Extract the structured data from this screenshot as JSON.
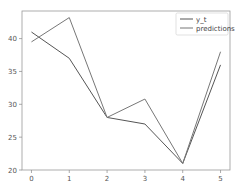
{
  "chart_data": {
    "type": "line",
    "title": "",
    "xlabel": "",
    "ylabel": "",
    "x": [
      0,
      1,
      2,
      3,
      4,
      5
    ],
    "series": [
      {
        "name": "y_t",
        "values": [
          41,
          37,
          28,
          27,
          21,
          36
        ],
        "color": "#555555"
      },
      {
        "name": "predictions",
        "values": [
          39.5,
          43.2,
          28,
          30.8,
          21,
          38
        ],
        "color": "#777777"
      }
    ],
    "xticks": [
      "0",
      "1",
      "2",
      "3",
      "4",
      "5"
    ],
    "yticks": [
      "20",
      "25",
      "30",
      "35",
      "40"
    ],
    "xlim": [
      -0.25,
      5.25
    ],
    "ylim": [
      20,
      44.2
    ],
    "grid": false,
    "legend_position": "upper right"
  },
  "legend": {
    "items": [
      {
        "label": "y_t"
      },
      {
        "label": "predictions"
      }
    ]
  }
}
